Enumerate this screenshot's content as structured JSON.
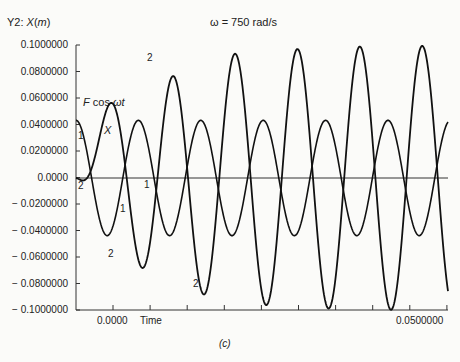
{
  "chart_data": {
    "type": "line",
    "title": "ω = 750 rad/s",
    "ylabel": "Y2: X(m)",
    "xlabel": "Time",
    "caption": "(c)",
    "ylim": [
      -0.1,
      0.1
    ],
    "xlim": [
      -0.005,
      0.05
    ],
    "x_tick_labels": [
      "0.0000",
      "0.0500000"
    ],
    "y_tick_labels": [
      "0.1000000",
      "0.0800000",
      "0.0600000",
      "0.0400000",
      "0.0200000",
      "0.0000",
      "-0.0200000",
      "-0.0400000",
      "-0.0600000",
      "-0.0800000",
      "-0.1000000"
    ],
    "grid": false,
    "series": [
      {
        "name": "F cos ωt",
        "marker_label": "1",
        "amplitude": 0.0435,
        "peaks_x_px": [
          76,
          136,
          199,
          261,
          323,
          386
        ],
        "description": "steady forcing cosine"
      },
      {
        "name": "X",
        "marker_label": "2",
        "peaks": [
          0.026,
          0.079,
          0.094,
          0.099,
          0.099,
          0.1
        ],
        "troughs": [
          -0.046,
          -0.062,
          -0.09,
          -0.097,
          -0.1,
          -0.1,
          -0.1
        ],
        "description": "response growing toward ±0.1 (beat/resonance)"
      }
    ],
    "annotations": [
      "F cos ωt",
      "X",
      "1",
      "2"
    ]
  },
  "labels": {
    "ylabel": "Y2: X(m)",
    "title": "ω = 750 rad/s",
    "xtick0": "0.0000",
    "xtime": "Time",
    "xtick_end": "0.0500000",
    "caption": "(c)",
    "fcos": "F cos ωt",
    "x": "X",
    "one": "1",
    "two": "2"
  }
}
